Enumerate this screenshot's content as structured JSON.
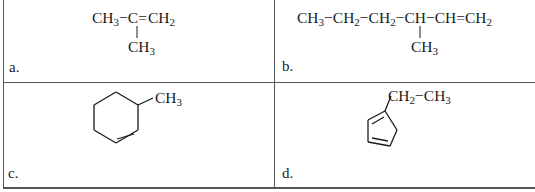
{
  "table": {
    "cells": [
      {
        "label": "a.",
        "formula": {
          "main_chain": [
            "CH3",
            "C",
            "CH2"
          ],
          "bonds": [
            "single",
            "double"
          ],
          "branch": {
            "attached_to": "C",
            "group": "CH3"
          }
        },
        "text": {
          "g1": "CH",
          "g1s": "3",
          "c": "C",
          "g2": "CH",
          "g2s": "2",
          "br": "CH",
          "brs": "3"
        }
      },
      {
        "label": "b.",
        "formula": {
          "main_chain": [
            "CH3",
            "CH2",
            "CH2",
            "CH",
            "CH",
            "CH2"
          ],
          "bonds": [
            "single",
            "single",
            "single",
            "single",
            "double"
          ],
          "branch": {
            "attached_to": "CH (4th)",
            "group": "CH3"
          }
        },
        "text": {
          "g1": "CH",
          "g1s": "3",
          "g2": "CH",
          "g2s": "2",
          "g3": "CH",
          "g3s": "2",
          "g4": "CH",
          "g5": "CH",
          "g6": "CH",
          "g6s": "2",
          "br": "CH",
          "brs": "3"
        }
      },
      {
        "label": "c.",
        "formula": {
          "ring": "cyclohexene",
          "double_bond": "ring bottom-right edge",
          "substituent": "CH3"
        },
        "text": {
          "sub": "CH",
          "subs": "3"
        }
      },
      {
        "label": "d.",
        "formula": {
          "ring": "cyclopentadiene",
          "double_bonds": 2,
          "substituent": "CH2-CH3"
        },
        "text": {
          "s1": "CH",
          "s1s": "2",
          "dash": "−",
          "s2": "CH",
          "s2s": "3"
        }
      }
    ]
  },
  "colors": {
    "border": "#555555",
    "ink": "#1a1a1a",
    "background": "#ffffff"
  }
}
